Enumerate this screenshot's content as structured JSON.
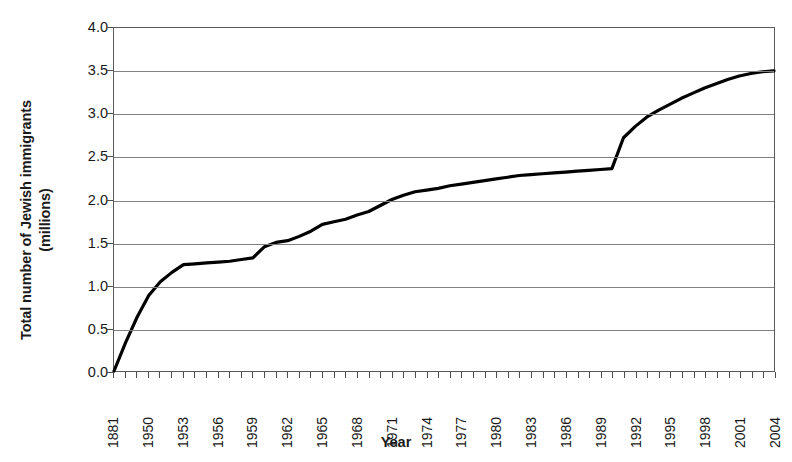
{
  "chart_data": {
    "type": "line",
    "title": "",
    "xlabel": "Year",
    "ylabel": "Total number of Jewish immigrants (millions)",
    "ylabel_line1": "Total number of Jewish immigrants",
    "ylabel_line2": "(millions)",
    "ylim": [
      0.0,
      4.0
    ],
    "ystep": 0.5,
    "ytick_labels": [
      "4.0",
      "3.5",
      "3.0",
      "2.5",
      "2.0",
      "1.5",
      "1.0",
      "0.5",
      "0.0"
    ],
    "ytick_values": [
      4.0,
      3.5,
      3.0,
      2.5,
      2.0,
      1.5,
      1.0,
      0.5,
      0.0
    ],
    "grid": "horizontal",
    "legend": "none",
    "line_color": "#000000",
    "line_width": 3.2,
    "categories": [
      "1881",
      "1882",
      "1883",
      "1950",
      "1951",
      "1952",
      "1953",
      "1954",
      "1955",
      "1956",
      "1957",
      "1958",
      "1959",
      "1960",
      "1961",
      "1962",
      "1963",
      "1964",
      "1965",
      "1966",
      "1967",
      "1968",
      "1969",
      "1970",
      "1971",
      "1972",
      "1973",
      "1974",
      "1975",
      "1976",
      "1977",
      "1978",
      "1979",
      "1980",
      "1981",
      "1982",
      "1983",
      "1984",
      "1985",
      "1986",
      "1987",
      "1988",
      "1989",
      "1990",
      "1991",
      "1992",
      "1993",
      "1994",
      "1995",
      "1996",
      "1997",
      "1998",
      "1999",
      "2000",
      "2001",
      "2002",
      "2003",
      "2004"
    ],
    "xtick_labels": [
      "1881",
      "1950",
      "1953",
      "1956",
      "1959",
      "1962",
      "1965",
      "1968",
      "1971",
      "1974",
      "1977",
      "1980",
      "1983",
      "1986",
      "1989",
      "1992",
      "1995",
      "1998",
      "2001",
      "2004"
    ],
    "xtick_label_every": 3,
    "series": [
      {
        "name": "Total number of Jewish immigrants",
        "values": [
          0.0,
          0.33,
          0.63,
          0.88,
          1.04,
          1.15,
          1.24,
          1.25,
          1.26,
          1.27,
          1.28,
          1.3,
          1.32,
          1.45,
          1.5,
          1.52,
          1.57,
          1.63,
          1.71,
          1.74,
          1.77,
          1.82,
          1.86,
          1.93,
          2.0,
          2.05,
          2.09,
          2.11,
          2.13,
          2.16,
          2.18,
          2.2,
          2.22,
          2.24,
          2.26,
          2.28,
          2.29,
          2.3,
          2.31,
          2.32,
          2.33,
          2.34,
          2.35,
          2.36,
          2.72,
          2.85,
          2.96,
          3.04,
          3.11,
          3.18,
          3.24,
          3.3,
          3.35,
          3.4,
          3.44,
          3.47,
          3.49,
          3.5
        ]
      }
    ],
    "notable_points": [
      {
        "year": "1881",
        "value": 0.0
      },
      {
        "year": "1950",
        "value": 1.24
      },
      {
        "year": "1959",
        "value": 1.5
      },
      {
        "year": "1971",
        "value": 2.0
      },
      {
        "year": "1989",
        "value": 2.35
      },
      {
        "year": "1992",
        "value": 2.85
      },
      {
        "year": "2004",
        "value": 3.5
      }
    ]
  }
}
